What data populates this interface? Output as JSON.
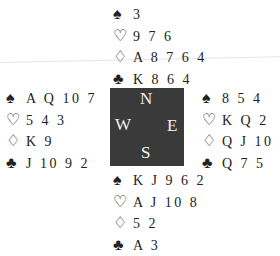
{
  "suits": {
    "spades": "♠",
    "hearts": "♡",
    "diamonds": "♢",
    "clubs": "♣"
  },
  "compass": {
    "north": "N",
    "south": "S",
    "west": "W",
    "east": "E"
  },
  "hands": {
    "north": {
      "spades": "3",
      "hearts": "9 7 6",
      "diamonds": "A 8 7 6 4",
      "clubs": "K 8 6 4"
    },
    "west": {
      "spades": "A Q 10 7",
      "hearts": "5 4 3",
      "diamonds": "K 9",
      "clubs": "J 10 9 2"
    },
    "east": {
      "spades": "8 5 4",
      "hearts": "K Q 2",
      "diamonds": "Q J 10 3",
      "clubs": "Q 7 5"
    },
    "south": {
      "spades": "K J 9 6 2",
      "hearts": "A J 10 8",
      "diamonds": "5 2",
      "clubs": "A 3"
    }
  },
  "colors": {
    "compass_bg": "#3a3a3a",
    "compass_text": "#f2f2f2",
    "text": "#222222"
  }
}
